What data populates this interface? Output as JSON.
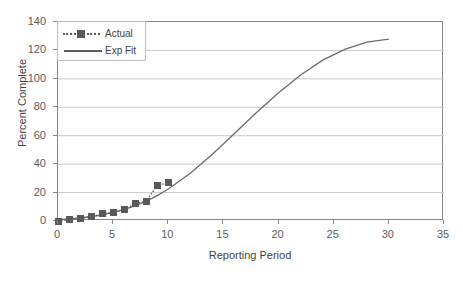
{
  "chart_data": {
    "type": "line",
    "title": "",
    "xlabel": "Reporting Period",
    "ylabel": "Percent Complete",
    "xlim": [
      0,
      35
    ],
    "ylim": [
      0,
      140
    ],
    "xticks": [
      0,
      5,
      10,
      15,
      20,
      25,
      30,
      35
    ],
    "yticks": [
      0,
      20,
      40,
      60,
      80,
      100,
      120,
      140
    ],
    "grid": "horizontal",
    "legend_position": "top-left",
    "series": [
      {
        "name": "Actual",
        "style": "dotted-with-square-markers",
        "color": "#5a5a5a",
        "x": [
          0,
          1,
          2,
          3,
          4,
          5,
          6,
          7,
          8,
          9,
          10
        ],
        "values": [
          0,
          1,
          2,
          3,
          5,
          6,
          8,
          12,
          14,
          25,
          27
        ]
      },
      {
        "name": "Exp Fit",
        "style": "solid-line",
        "color": "#6b6b6b",
        "x": [
          0,
          1,
          2,
          3,
          4,
          5,
          6,
          7,
          8,
          9,
          10,
          12,
          14,
          16,
          18,
          20,
          22,
          24,
          26,
          28,
          30
        ],
        "values": [
          0.9,
          1.4,
          2.1,
          3.0,
          4.3,
          6.0,
          8.1,
          10.7,
          14.0,
          17.9,
          22.5,
          33.6,
          47.0,
          61.6,
          76.3,
          90.2,
          102.7,
          113.2,
          120.8,
          125.8,
          128.0
        ]
      }
    ]
  },
  "axis": {
    "x_title": "Reporting Period",
    "y_title": "Percent Complete",
    "x_tick_labels": [
      "0",
      "5",
      "10",
      "15",
      "20",
      "25",
      "30",
      "35"
    ],
    "y_tick_labels": [
      "0",
      "20",
      "40",
      "60",
      "80",
      "100",
      "120",
      "140"
    ]
  },
  "legend": {
    "entries": [
      {
        "label": "Actual",
        "symbol": "dotted-square-marker"
      },
      {
        "label": "Exp Fit",
        "symbol": "solid-line"
      }
    ]
  },
  "colors": {
    "series_actual": "#5a5a5a",
    "series_fit": "#6b6b6b",
    "gridline": "#c9c9c9",
    "frame": "#868686",
    "tick_text": "#5b5b5b",
    "axis_title_text": "#3f3f3f",
    "background": "#ffffff"
  }
}
